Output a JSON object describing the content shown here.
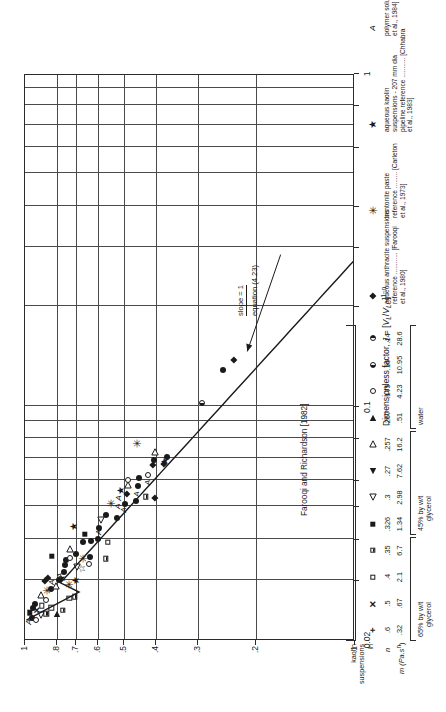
{
  "chart_data": {
    "type": "scatter",
    "title": "",
    "xlabel": "Dimensionless factor, J = [V_L/V_LC]^(1-n)",
    "ylabel": "Minimum drag ratio, (Φ²_C) min",
    "xscale": "log",
    "yscale": "log",
    "xlim": [
      0.02,
      1
    ],
    "ylim": [
      0.1,
      1
    ],
    "xticks": [
      "0.02",
      "0.1",
      "1"
    ],
    "yticks": [
      "1",
      ".8",
      ".7",
      ".6",
      ".5",
      ".4",
      ".3",
      ".2",
      ".1"
    ],
    "grid": true,
    "annotations": [
      {
        "text": "slope = 1",
        "x": 0.3,
        "y": 0.175
      },
      {
        "text": "equation (4.23)",
        "x": 0.3,
        "y": 0.158
      },
      {
        "text": "Farooqi and Richardson [1982]",
        "x": 0.055,
        "y": 0.115
      }
    ],
    "trend_line": {
      "slope": 1,
      "description": "equation (4.23)"
    },
    "series": [
      {
        "name": "kaolin in 65% glycerol, n=.6, m=.32",
        "marker": "plus"
      },
      {
        "name": "kaolin in 65% glycerol, n=.5, m=.67",
        "marker": "cross"
      },
      {
        "name": "kaolin in 65% glycerol, n=.4, m=2.1",
        "marker": "square-open"
      },
      {
        "name": "kaolin in 65% glycerol, n=.35, m=6.7",
        "marker": "square-half-bottom"
      },
      {
        "name": "kaolin in 45% glycerol, n=.326, m=1.34",
        "marker": "square-filled"
      },
      {
        "name": "kaolin in 45% glycerol, n=.3, m=2.98",
        "marker": "triangle-left-open"
      },
      {
        "name": "kaolin in 45% glycerol, n=.27, m=7.62",
        "marker": "triangle-left-filled"
      },
      {
        "name": "kaolin in 45% glycerol, n=.257, m=16.2",
        "marker": "triangle-right-open"
      },
      {
        "name": "kaolin in water, n=.267, m=.51",
        "marker": "triangle-right-filled"
      },
      {
        "name": "kaolin in water, n=.175, m=4.23",
        "marker": "circle-open"
      },
      {
        "name": "kaolin in water, n=.16, m=10.95",
        "marker": "circle-half-left"
      },
      {
        "name": "kaolin in water, n=.14, m=28.6",
        "marker": "circle-half-right"
      },
      {
        "name": "aqueous anthracite suspensions [Farooqi et al., 1980]",
        "marker": "diamond-filled"
      },
      {
        "name": "bentonite paste [Carleton et al., 1973]",
        "marker": "asterisk"
      },
      {
        "name": "aqueous kaolin suspensions - 207 mm dia pipeline [Chhabra et al., 1983]",
        "marker": "star-filled"
      },
      {
        "name": "polymer solutions [Chhabra et al., 1984]",
        "marker": "letter-A"
      }
    ]
  },
  "axes": {
    "y_title_prefix": "Minimum drag ratio, (",
    "y_title_phi": "Φ",
    "y_title_sup": "2",
    "y_title_sub": "C",
    "y_title_suffix": ") min",
    "x_title_prefix": "Dimensionless factor, ",
    "x_title_J": "J",
    "x_title_eq": " = [",
    "x_title_VL": "V",
    "x_title_VL_sub": "L",
    "x_title_slash": "/",
    "x_title_VLC": "V",
    "x_title_VLC_sub": "LC",
    "x_title_close": "]",
    "x_title_exp": "1−n",
    "yticks": [
      "1",
      ".8",
      ".7",
      ".6",
      ".5",
      ".4",
      ".3",
      ".2",
      ".1"
    ],
    "xticks": [
      "0.02",
      "0.1",
      "1"
    ]
  },
  "annotations": {
    "slope": "slope = 1",
    "equation": "equation (4.23)",
    "farooqi_group": "Farooqi and Richardson [1982]"
  },
  "legend": {
    "header_n": "n",
    "header_m": "m (Pa.s",
    "header_m_sup": "n",
    "header_m_close": ")",
    "group_labels": {
      "kaolin": "kaolin",
      "suspensions": "suspensions",
      "in": "in",
      "glycerol65": "65% by w/t",
      "glycerol65b": "glycerol",
      "glycerol45": "45% by w/t",
      "glycerol45b": "glycerol",
      "water": "water"
    },
    "rows": [
      {
        "symbol": "plus",
        "n": ".6",
        "m": ".32"
      },
      {
        "symbol": "cross",
        "n": ".5",
        "m": ".67"
      },
      {
        "symbol": "square-open",
        "n": ".4",
        "m": "2.1"
      },
      {
        "symbol": "square-half-bottom",
        "n": ".35",
        "m": "6.7"
      },
      {
        "symbol": "square-filled",
        "n": ".326",
        "m": "1.34"
      },
      {
        "symbol": "triangle-left-open",
        "n": ".3",
        "m": "2.98"
      },
      {
        "symbol": "triangle-left-filled",
        "n": ".27",
        "m": "7.62"
      },
      {
        "symbol": "triangle-right-open",
        "n": ".257",
        "m": "16.2"
      },
      {
        "symbol": "triangle-right-filled",
        "n": ".267",
        "m": ".51"
      },
      {
        "symbol": "circle-open",
        "n": ".175",
        "m": "4.23"
      },
      {
        "symbol": "circle-half-left",
        "n": ".16",
        "m": "10.95"
      },
      {
        "symbol": "circle-half-right",
        "n": ".14",
        "m": "28.6"
      }
    ],
    "extra_rows": [
      {
        "symbol": "diamond-filled",
        "lines": [
          "aqueous anthracite suspensions",
          "reference ............ [Farooqi",
          "et al., 1980]"
        ]
      },
      {
        "symbol": "asterisk",
        "lines": [
          "bentonite paste",
          "reference ......... [Carleton",
          "et al., 1973]"
        ]
      },
      {
        "symbol": "star-filled",
        "lines": [
          "aqueous kaolin",
          "suspensions - 207 mm dia",
          "pipeline reference ........... [Chhabra",
          "et al., 1983]"
        ]
      },
      {
        "symbol": "letter-A",
        "lines": [
          "polymer solutions [Chhabra",
          "et al., 1984]"
        ]
      }
    ]
  },
  "points": [
    {
      "x": 0.0225,
      "y": 0.975,
      "m": "letter-A"
    },
    {
      "x": 0.0232,
      "y": 0.955,
      "m": "circle-filled"
    },
    {
      "x": 0.024,
      "y": 0.965,
      "m": "square-filled"
    },
    {
      "x": 0.0248,
      "y": 0.945,
      "m": "circle-filled"
    },
    {
      "x": 0.0228,
      "y": 0.925,
      "m": "circle-open"
    },
    {
      "x": 0.0245,
      "y": 0.92,
      "m": "cross"
    },
    {
      "x": 0.0255,
      "y": 0.93,
      "m": "circle-filled"
    },
    {
      "x": 0.0236,
      "y": 0.895,
      "m": "triangle-left-open"
    },
    {
      "x": 0.0252,
      "y": 0.89,
      "m": "square-open"
    },
    {
      "x": 0.0272,
      "y": 0.893,
      "m": "triangle-right-open"
    },
    {
      "x": 0.0238,
      "y": 0.862,
      "m": "square-half-bottom"
    },
    {
      "x": 0.0262,
      "y": 0.866,
      "m": "circle-open"
    },
    {
      "x": 0.028,
      "y": 0.86,
      "m": "asterisk"
    },
    {
      "x": 0.0298,
      "y": 0.868,
      "m": "diamond-filled"
    },
    {
      "x": 0.0305,
      "y": 0.852,
      "m": "diamond-filled"
    },
    {
      "x": 0.0248,
      "y": 0.832,
      "m": "square-open"
    },
    {
      "x": 0.0283,
      "y": 0.835,
      "m": "circle-filled"
    },
    {
      "x": 0.0296,
      "y": 0.826,
      "m": "letter-A"
    },
    {
      "x": 0.0355,
      "y": 0.83,
      "m": "square-filled"
    },
    {
      "x": 0.0237,
      "y": 0.8,
      "m": "triangle-right-filled"
    },
    {
      "x": 0.0288,
      "y": 0.805,
      "m": "triangle-right-open"
    },
    {
      "x": 0.03,
      "y": 0.79,
      "m": "circle-filled"
    },
    {
      "x": 0.031,
      "y": 0.785,
      "m": "letter-A"
    },
    {
      "x": 0.0244,
      "y": 0.768,
      "m": "square-half-bottom"
    },
    {
      "x": 0.0304,
      "y": 0.772,
      "m": "star-filled"
    },
    {
      "x": 0.0318,
      "y": 0.762,
      "m": "circle-filled"
    },
    {
      "x": 0.0334,
      "y": 0.758,
      "m": "circle-filled"
    },
    {
      "x": 0.0345,
      "y": 0.752,
      "m": "circle-filled"
    },
    {
      "x": 0.0265,
      "y": 0.735,
      "m": "square-open"
    },
    {
      "x": 0.0292,
      "y": 0.738,
      "m": "asterisk"
    },
    {
      "x": 0.035,
      "y": 0.728,
      "m": "circle-open"
    },
    {
      "x": 0.0372,
      "y": 0.733,
      "m": "triangle-right-open"
    },
    {
      "x": 0.0268,
      "y": 0.705,
      "m": "square-half-bottom"
    },
    {
      "x": 0.03,
      "y": 0.7,
      "m": "star-filled"
    },
    {
      "x": 0.033,
      "y": 0.698,
      "m": "triangle-left-open"
    },
    {
      "x": 0.036,
      "y": 0.702,
      "m": "circle-filled"
    },
    {
      "x": 0.0435,
      "y": 0.712,
      "m": "star-filled"
    },
    {
      "x": 0.0325,
      "y": 0.672,
      "m": "star-open"
    },
    {
      "x": 0.0348,
      "y": 0.668,
      "m": "asterisk"
    },
    {
      "x": 0.039,
      "y": 0.665,
      "m": "circle-filled"
    },
    {
      "x": 0.0412,
      "y": 0.66,
      "m": "square-filled"
    },
    {
      "x": 0.0335,
      "y": 0.64,
      "m": "circle-open"
    },
    {
      "x": 0.0352,
      "y": 0.636,
      "m": "circle-filled"
    },
    {
      "x": 0.0395,
      "y": 0.63,
      "m": "circle-filled"
    },
    {
      "x": 0.04,
      "y": 0.6,
      "m": "circle-filled"
    },
    {
      "x": 0.0418,
      "y": 0.598,
      "m": "letter-A"
    },
    {
      "x": 0.0432,
      "y": 0.595,
      "m": "circle-filled"
    },
    {
      "x": 0.0455,
      "y": 0.588,
      "m": "triangle-left-open"
    },
    {
      "x": 0.0348,
      "y": 0.568,
      "m": "square-half-bottom"
    },
    {
      "x": 0.039,
      "y": 0.562,
      "m": "square-open"
    },
    {
      "x": 0.047,
      "y": 0.57,
      "m": "circle-filled"
    },
    {
      "x": 0.051,
      "y": 0.548,
      "m": "asterisk"
    },
    {
      "x": 0.0462,
      "y": 0.528,
      "m": "circle-filled"
    },
    {
      "x": 0.05,
      "y": 0.522,
      "m": "letter-A"
    },
    {
      "x": 0.053,
      "y": 0.518,
      "m": "letter-A"
    },
    {
      "x": 0.056,
      "y": 0.512,
      "m": "star-filled"
    },
    {
      "x": 0.0488,
      "y": 0.5,
      "m": "letter-A"
    },
    {
      "x": 0.0508,
      "y": 0.496,
      "m": "circle-filled"
    },
    {
      "x": 0.0545,
      "y": 0.492,
      "m": "diamond-filled"
    },
    {
      "x": 0.0578,
      "y": 0.486,
      "m": "triangle-right-open"
    },
    {
      "x": 0.06,
      "y": 0.488,
      "m": "circle-open"
    },
    {
      "x": 0.052,
      "y": 0.462,
      "m": "circle-filled"
    },
    {
      "x": 0.0545,
      "y": 0.458,
      "m": "letter-A"
    },
    {
      "x": 0.0575,
      "y": 0.455,
      "m": "circle-filled"
    },
    {
      "x": 0.061,
      "y": 0.452,
      "m": "circle-filled"
    },
    {
      "x": 0.0775,
      "y": 0.458,
      "m": "asterisk"
    },
    {
      "x": 0.0535,
      "y": 0.43,
      "m": "square-half-bottom"
    },
    {
      "x": 0.059,
      "y": 0.425,
      "m": "letter-A"
    },
    {
      "x": 0.062,
      "y": 0.424,
      "m": "circle-open"
    },
    {
      "x": 0.053,
      "y": 0.405,
      "m": "diamond-filled"
    },
    {
      "x": 0.0665,
      "y": 0.408,
      "m": "diamond-filled"
    },
    {
      "x": 0.069,
      "y": 0.406,
      "m": "circle-filled"
    },
    {
      "x": 0.073,
      "y": 0.404,
      "m": "triangle-right-open"
    },
    {
      "x": 0.0672,
      "y": 0.378,
      "m": "diamond-filled"
    },
    {
      "x": 0.068,
      "y": 0.376,
      "m": "star-filled"
    },
    {
      "x": 0.0705,
      "y": 0.37,
      "m": "circle-filled"
    },
    {
      "x": 0.102,
      "y": 0.29,
      "m": "circle-half-left"
    },
    {
      "x": 0.128,
      "y": 0.252,
      "m": "circle-filled"
    },
    {
      "x": 0.138,
      "y": 0.232,
      "m": "diamond-filled"
    }
  ]
}
